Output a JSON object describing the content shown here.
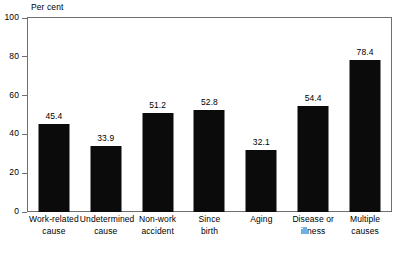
{
  "chart_data": {
    "type": "bar",
    "title": "",
    "subtitle": "",
    "xlabel": "",
    "ylabel": "Per cent",
    "ylim": [
      0,
      100
    ],
    "yticks": [
      0,
      20,
      40,
      60,
      80,
      100
    ],
    "grid": false,
    "legend": false,
    "legend_position": "none",
    "orientation": "vertical",
    "bar_color": "#0b0b0b",
    "value_label_format": "one-decimal",
    "categories": [
      "Work-related cause",
      "Undetermined cause",
      "Non-work accident",
      "Since birth",
      "Aging",
      "Disease or illness",
      "Multiple causes"
    ],
    "category_lines": [
      [
        "Work-related",
        "cause"
      ],
      [
        "Undetermined",
        "cause"
      ],
      [
        "Non-work",
        "accident"
      ],
      [
        "Since",
        "birth"
      ],
      [
        "Aging",
        ""
      ],
      [
        "Disease or",
        "illness"
      ],
      [
        "Multiple",
        "causes"
      ]
    ],
    "values": [
      45.4,
      33.9,
      51.2,
      52.8,
      32.1,
      54.4,
      78.4
    ],
    "value_labels": [
      "45.4",
      "33.9",
      "51.2",
      "52.8",
      "32.1",
      "54.4",
      "78.4"
    ],
    "ytick_labels": [
      "0",
      "20",
      "40",
      "60",
      "80",
      "100"
    ]
  },
  "axis": {
    "y_title": "Per cent"
  }
}
